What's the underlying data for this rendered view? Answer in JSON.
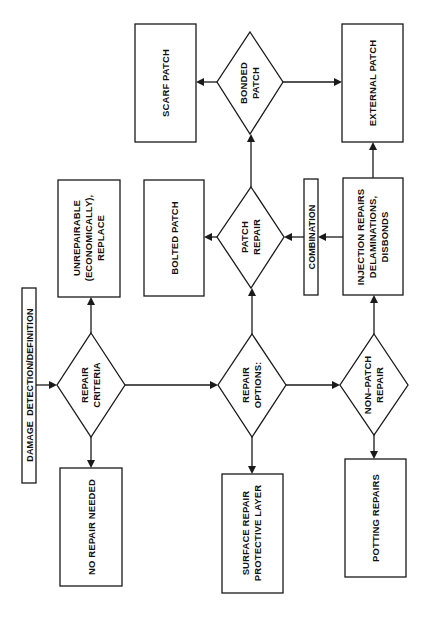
{
  "diagram": {
    "orientation": "rotated 90deg counter-clockwise (reads bottom-to-top)",
    "colors": {
      "stroke": "#1a1a1a",
      "text": "#111111",
      "background": "#ffffff"
    },
    "nodes": {
      "damage_detection": {
        "label": "DAMAGE  DETECTION/DEFINITION",
        "shape": "box"
      },
      "repair_criteria": {
        "lines": [
          "REPAIR",
          "CRITERIA"
        ],
        "shape": "diamond"
      },
      "unrepairable": {
        "lines": [
          "UNREPAIRABLE",
          "(ECONOMICALLY),",
          "REPLACE"
        ],
        "shape": "box"
      },
      "no_repair_needed": {
        "label": "NO REPAIR NEEDED",
        "shape": "box"
      },
      "repair_options": {
        "lines": [
          "REPAIR",
          "OPTIONS:"
        ],
        "shape": "diamond"
      },
      "surface_repair": {
        "lines": [
          "SURFACE REPAIR",
          "PROTECTIVE LAYER"
        ],
        "shape": "box"
      },
      "patch_repair": {
        "lines": [
          "PATCH",
          "REPAIR"
        ],
        "shape": "diamond"
      },
      "bolted_patch": {
        "label": "BOLTED PATCH",
        "shape": "box"
      },
      "bonded_patch": {
        "lines": [
          "BONDED",
          "PATCH"
        ],
        "shape": "diamond"
      },
      "scarf_patch": {
        "label": "SCARF PATCH",
        "shape": "box"
      },
      "external_patch": {
        "label": "EXTERNAL PATCH",
        "shape": "box"
      },
      "non_patch_repair": {
        "lines": [
          "NON–PATCH",
          "REPAIR"
        ],
        "shape": "diamond"
      },
      "potting_repairs": {
        "label": "POTTING REPAIRS",
        "shape": "box"
      },
      "injection_repairs": {
        "lines": [
          "INJECTION REPAIRS",
          "DELAMINATIONS,",
          "DISBONDS"
        ],
        "shape": "box"
      },
      "combination": {
        "label": "COMBINATION",
        "shape": "box"
      }
    },
    "edges": [
      {
        "from": "damage_detection",
        "to": "repair_criteria"
      },
      {
        "from": "repair_criteria",
        "to": "unrepairable"
      },
      {
        "from": "repair_criteria",
        "to": "no_repair_needed"
      },
      {
        "from": "repair_criteria",
        "to": "repair_options"
      },
      {
        "from": "repair_options",
        "to": "patch_repair"
      },
      {
        "from": "repair_options",
        "to": "surface_repair"
      },
      {
        "from": "repair_options",
        "to": "non_patch_repair"
      },
      {
        "from": "patch_repair",
        "to": "bolted_patch"
      },
      {
        "from": "patch_repair",
        "to": "bonded_patch"
      },
      {
        "from": "bonded_patch",
        "to": "scarf_patch"
      },
      {
        "from": "bonded_patch",
        "to": "external_patch"
      },
      {
        "from": "non_patch_repair",
        "to": "potting_repairs"
      },
      {
        "from": "non_patch_repair",
        "to": "injection_repairs"
      },
      {
        "from": "injection_repairs",
        "to": "external_patch"
      },
      {
        "from": "injection_repairs",
        "to": "combination"
      },
      {
        "from": "combination",
        "to": "patch_repair"
      }
    ]
  }
}
